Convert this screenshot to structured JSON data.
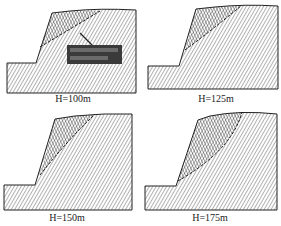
{
  "figure": {
    "panels": [
      {
        "id": "p1",
        "label": "H=100m",
        "label_pos": [
          73,
          94
        ],
        "outline": "M7,93 L7,63 L36,63 L52,13 L70,11 Q100,8 136,10 L136,93 Z",
        "slip_region": "M40,47 L52,13 L70,11 Q88,10 100,11 Z",
        "slip_line": "M40,47 Q72,28 100,11",
        "annotation_box": {
          "x": 67,
          "y": 45,
          "w": 55,
          "h": 19,
          "text": "",
          "note": "illegible text in dark label box"
        },
        "annotation_arrow": "M92,45 L80,33"
      },
      {
        "id": "p2",
        "label": "H=125m",
        "label_pos": [
          216,
          94
        ],
        "outline": "M148,89 L148,66 L179,66 L196,9 L215,7 Q245,4 278,6 L278,89 Z",
        "slip_region": "M185,50 L196,9 L215,7 Q230,6 241,6 Z",
        "slip_line": "M185,50 Q212,30 241,6"
      },
      {
        "id": "p3",
        "label": "H=150m",
        "label_pos": [
          67,
          213
        ],
        "outline": "M4,210 L4,185 L35,185 L55,119 L75,116 Q105,113 132,114 L132,210 Z",
        "slip_region": "M40,175 L55,119 L75,116 L95,114 Q68,140 40,175 Z",
        "slip_line": "M40,175 Q66,142 95,114"
      },
      {
        "id": "p4",
        "label": "H=175m",
        "label_pos": [
          210,
          213
        ],
        "outline": "M145,210 L145,186 L176,186 L198,120 L210,116 Q240,110 277,114 L277,210 Z",
        "slip_region": "M178,181 L198,120 L210,116 Q228,112 242,112 Q230,150 178,181 Z",
        "slip_line": "M178,181 Q232,150 242,112"
      }
    ],
    "colors": {
      "outline": "#222222",
      "hatch": "#555555",
      "slip_hatch": "#333333",
      "annotation_box": "#3a3a3a",
      "caption": "#222222"
    }
  }
}
